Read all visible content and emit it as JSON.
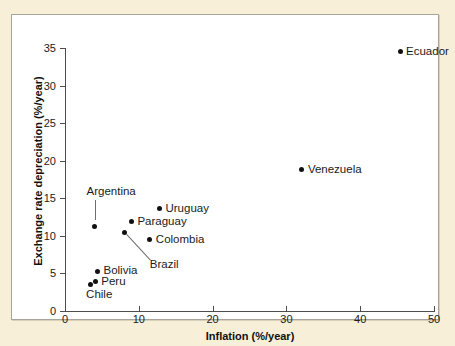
{
  "chart_data": {
    "type": "scatter",
    "title": "",
    "xlabel": "Inflation (%/year)",
    "ylabel": "Exchange rate depreciation (%/year)",
    "xlim": [
      0,
      50
    ],
    "ylim": [
      0,
      35
    ],
    "xticks": [
      "0",
      "10",
      "20",
      "30",
      "40",
      "50"
    ],
    "xtick_values": [
      0,
      10,
      20,
      30,
      40,
      50
    ],
    "yticks": [
      "0",
      "5",
      "10",
      "15",
      "20",
      "25",
      "30",
      "35"
    ],
    "ytick_values": [
      0,
      5,
      10,
      15,
      20,
      25,
      30,
      35
    ],
    "grid": false,
    "legend": false,
    "marker_color": "#111111",
    "points": [
      {
        "label": "Ecuador",
        "x": 45.4,
        "y": 34.5,
        "label_pos": "right",
        "leader": false
      },
      {
        "label": "Venezuela",
        "x": 32.1,
        "y": 18.8,
        "label_pos": "right",
        "leader": false
      },
      {
        "label": "Uruguay",
        "x": 12.8,
        "y": 13.6,
        "label_pos": "right",
        "leader": false
      },
      {
        "label": "Paraguay",
        "x": 9.0,
        "y": 11.9,
        "label_pos": "right",
        "leader": false
      },
      {
        "label": "Argentina",
        "x": 4.0,
        "y": 11.3,
        "label_pos": "above",
        "leader": true
      },
      {
        "label": "Brazil",
        "x": 8.1,
        "y": 10.5,
        "label_pos": "below-right",
        "leader": true
      },
      {
        "label": "Colombia",
        "x": 11.5,
        "y": 9.5,
        "label_pos": "right",
        "leader": false
      },
      {
        "label": "Bolivia",
        "x": 4.4,
        "y": 5.3,
        "label_pos": "right",
        "leader": false
      },
      {
        "label": "Peru",
        "x": 4.1,
        "y": 3.9,
        "label_pos": "right",
        "leader": false
      },
      {
        "label": "Chile",
        "x": 3.4,
        "y": 3.5,
        "label_pos": "below",
        "leader": false
      }
    ]
  },
  "figure": {
    "background_color": "#f7efd8",
    "panel_color": "#ffffff",
    "border_color": "#a8a49a",
    "axis_color": "#4d4d4d"
  }
}
